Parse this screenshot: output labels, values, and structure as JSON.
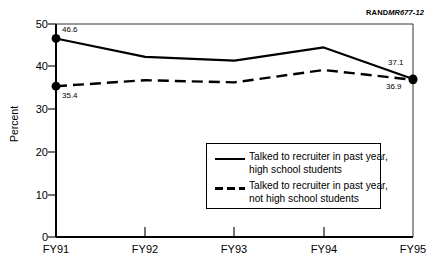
{
  "figure": {
    "rand_id_bold": "RAND",
    "rand_id_italic": "MR677-12"
  },
  "chart_data": {
    "type": "line",
    "title": "",
    "subtitle": "",
    "xlabel": "",
    "ylabel": "Percent",
    "categories": [
      "FY91",
      "FY92",
      "FY93",
      "FY94",
      "FY95"
    ],
    "ylim": [
      0,
      50
    ],
    "yticks": [
      0,
      10,
      20,
      30,
      40,
      50
    ],
    "ytick_labels": [
      "0",
      "10",
      "20",
      "30",
      "40",
      "50"
    ],
    "grid": false,
    "legend_position": "inside-lower-right",
    "series": [
      {
        "name": "Talked to recruiter in past year, high school students",
        "style": "solid",
        "values": [
          46.6,
          42.3,
          41.4,
          44.5,
          37.1
        ],
        "markers_at": [
          "FY91",
          "FY95"
        ]
      },
      {
        "name": "Talked to recruiter in past year, not high school students",
        "style": "dashed",
        "values": [
          35.4,
          36.8,
          36.3,
          39.2,
          36.9
        ],
        "markers_at": [
          "FY91",
          "FY95"
        ]
      }
    ],
    "annotations": [
      {
        "text": "46.6",
        "series": "Talked to recruiter in past year, high school students",
        "category": "FY91"
      },
      {
        "text": "35.4",
        "series": "Talked to recruiter in past year, not high school students",
        "category": "FY91"
      },
      {
        "text": "37.1",
        "series": "Talked to recruiter in past year, high school students",
        "category": "FY95"
      },
      {
        "text": "36.9",
        "series": "Talked to recruiter in past year, not high school students",
        "category": "FY95"
      }
    ],
    "legend_entries": [
      {
        "line1": "Talked to recruiter in past year,",
        "line2": "high school students",
        "style": "solid"
      },
      {
        "line1": "Talked to recruiter in past year,",
        "line2": "not high school students",
        "style": "dashed"
      }
    ],
    "colors": {
      "line": "#000000",
      "axis": "#000000",
      "background": "#ffffff"
    }
  }
}
